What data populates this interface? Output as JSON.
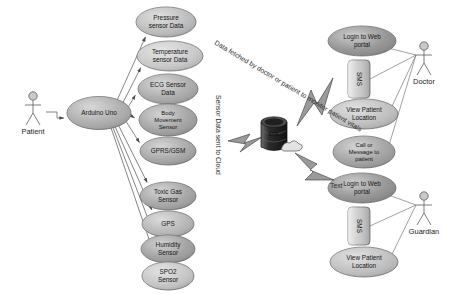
{
  "diagram": {
    "type": "uml-use-case"
  },
  "actors": [
    {
      "id": "patient",
      "name": "Patient",
      "x": 33,
      "y": 112
    },
    {
      "id": "doctor",
      "name": "Doctor",
      "x": 424,
      "y": 62
    },
    {
      "id": "guardian",
      "name": "Guardian",
      "x": 424,
      "y": 212
    }
  ],
  "hub": {
    "label": "Arduino Uno",
    "cx": 99,
    "cy": 113,
    "rx": 32,
    "ry": 16.5,
    "shade": "#a8a8a8"
  },
  "sensors": [
    {
      "id": "pressure",
      "label": "Pressure\nsensor Data",
      "cx": 166,
      "cy": 22,
      "rx": 30,
      "ry": 15,
      "shade": "#b9b9b9"
    },
    {
      "id": "temperature",
      "label": "Temperature\nsensor Data",
      "cx": 170,
      "cy": 56,
      "rx": 33,
      "ry": 15,
      "shade": "#c6c6c6"
    },
    {
      "id": "ecg",
      "label": "ECG Sensor\nData",
      "cx": 168,
      "cy": 89,
      "rx": 30,
      "ry": 15,
      "shade": "#a6a6a6"
    },
    {
      "id": "body",
      "label": "Body\nMovement\nSensor",
      "cx": 168,
      "cy": 120,
      "rx": 29,
      "ry": 16,
      "shade": "#9e9e9e"
    },
    {
      "id": "gprs",
      "label": "GPRS/GSM",
      "cx": 168,
      "cy": 151,
      "rx": 28,
      "ry": 14,
      "shade": "#a2a2a2"
    },
    {
      "id": "toxicgas",
      "label": "Toxic Gas\nSensor",
      "cx": 168,
      "cy": 196,
      "rx": 28,
      "ry": 14,
      "shade": "#a0a0a0"
    },
    {
      "id": "gps",
      "label": "GPS",
      "cx": 168,
      "cy": 224,
      "rx": 26,
      "ry": 13,
      "shade": "#b2b2b2"
    },
    {
      "id": "humidity",
      "label": "Humidity\nSensor",
      "cx": 168,
      "cy": 249,
      "rx": 27,
      "ry": 14,
      "shade": "#9b9b9b"
    },
    {
      "id": "spo2",
      "label": "SPO2\nSensor",
      "cx": 168,
      "cy": 276,
      "rx": 26,
      "ry": 14,
      "shade": "#c2c2c2"
    }
  ],
  "doctor_cases": [
    {
      "id": "doc-login",
      "label": "Login to Web\nportal",
      "cx": 362,
      "cy": 41,
      "rx": 34,
      "ry": 15,
      "shade": "#8e8e8e"
    },
    {
      "id": "doc-sms",
      "label": "SMS",
      "shape": "rect",
      "x": 348,
      "y": 60,
      "w": 22,
      "h": 38,
      "shade": "#c9c9c9"
    },
    {
      "id": "doc-view",
      "label": "View Patient\nLocation",
      "cx": 364,
      "cy": 114,
      "rx": 34,
      "ry": 15,
      "shade": "#bcbcbc"
    },
    {
      "id": "doc-call",
      "label": "Call or\nMessage to\npatient",
      "cx": 364,
      "cy": 152,
      "rx": 31,
      "ry": 16,
      "shade": "#9d9d9d"
    }
  ],
  "guardian_cases": [
    {
      "id": "grd-login",
      "label": "Login to Web\nportal",
      "cx": 362,
      "cy": 188,
      "rx": 34,
      "ry": 15,
      "shade": "#8e8e8e"
    },
    {
      "id": "grd-sms",
      "label": "SMS",
      "shape": "rect",
      "x": 348,
      "y": 207,
      "w": 22,
      "h": 38,
      "shade": "#c9c9c9"
    },
    {
      "id": "grd-view",
      "label": "View Patient\nLocation",
      "cx": 364,
      "cy": 262,
      "rx": 34,
      "ry": 15,
      "shade": "#bcbcbc"
    }
  ],
  "database": {
    "label": "SQL",
    "cx": 274,
    "cy": 136
  },
  "notes": [
    {
      "id": "note-sensor-cloud",
      "text": "Sensor Data sent to Cloud",
      "x": 216,
      "y": 95,
      "rotate": 90
    },
    {
      "id": "note-data-fetched",
      "text": "Data fetched by doctor or patient to monitor patient vitals",
      "x": 214,
      "y": 44,
      "rotate": 31
    },
    {
      "id": "note-text",
      "text": "Text",
      "x": 330,
      "y": 188,
      "rotate": 0
    }
  ],
  "colors": {
    "edge": "#5b5b5b",
    "bolt_fill": "#9a9a9a",
    "bolt_stroke": "#4a4a4a",
    "hub_fill": "#a8a8a8",
    "background": "#ffffff"
  }
}
